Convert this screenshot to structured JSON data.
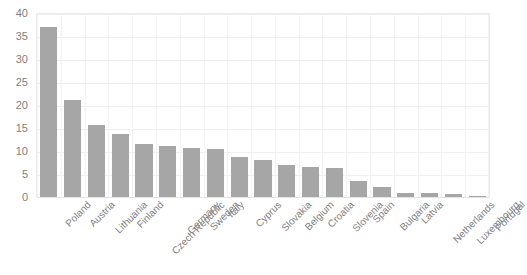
{
  "chart_data": {
    "type": "bar",
    "title": "",
    "subtitle": "",
    "xlabel": "",
    "ylabel": "",
    "ylim": [
      0,
      40
    ],
    "yticks": [
      0,
      5,
      10,
      15,
      20,
      25,
      30,
      35,
      40
    ],
    "ytick_labels": [
      "0",
      "5",
      "10",
      "15",
      "20",
      "25",
      "30",
      "35",
      "40"
    ],
    "grid": true,
    "legend": false,
    "legend_position": "none",
    "bar_color": "#a6a6a6",
    "gridline_color": "#efefef",
    "axis_text_color": "#7f7f7f",
    "categories": [
      "Poland",
      "Austria",
      "Lithuania",
      "Finland",
      "Czech Republic",
      "Germany",
      "Sweden",
      "Italy",
      "Cyprus",
      "Slovakia",
      "Belgium",
      "Croatia",
      "Slovenia",
      "Spain",
      "Bulgaria",
      "Latvia",
      "Netherlands",
      "Luxembourg",
      "Portugal"
    ],
    "values": [
      37,
      21,
      15.7,
      13.8,
      11.6,
      11,
      10.6,
      10.5,
      8.8,
      8,
      7,
      6.6,
      6.4,
      3.5,
      2.2,
      0.8,
      0.8,
      0.6,
      0.2
    ]
  }
}
